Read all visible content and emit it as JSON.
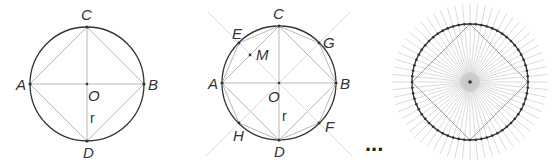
{
  "figures": [
    {
      "id": "square-inscribed",
      "center": [
        87,
        84
      ],
      "radius": 57,
      "labels": {
        "A": "A",
        "B": "B",
        "C": "C",
        "D": "D",
        "O": "O",
        "r": "r"
      }
    },
    {
      "id": "octagon-inscribed",
      "center": [
        279,
        83
      ],
      "radius": 57,
      "labels": {
        "A": "A",
        "B": "B",
        "C": "C",
        "D": "D",
        "E": "E",
        "F": "F",
        "G": "G",
        "H": "H",
        "M": "M",
        "O": "O",
        "r": "r"
      }
    },
    {
      "id": "many-sided-polygon",
      "center": [
        470,
        82
      ],
      "radius": 58,
      "vertex_count": 64
    }
  ],
  "ellipsis": "...",
  "colors": {
    "circle": "#333333",
    "chords": "#b8b8b8",
    "rays": "#dcdcdc",
    "text": "#333333"
  }
}
